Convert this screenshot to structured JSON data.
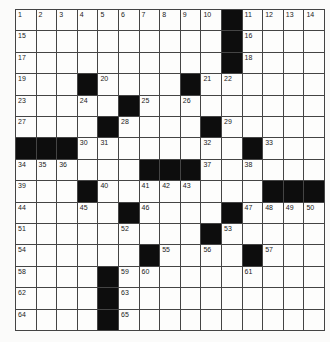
{
  "puzzle": {
    "rows": 15,
    "cols": 15,
    "colors": {
      "black": "#0d0d0d",
      "white": "#fdfdfc",
      "line": "#444444"
    },
    "layout": [
      "..........#....",
      "..........#....",
      "..........#....",
      "...#....#......",
      ".....#.........",
      "....#....#.....",
      "###........#...",
      "......###......",
      "...#........###",
      ".....#....#....",
      ".........#.....",
      "......#....#...",
      "....#..........",
      "....#..........",
      "....#.........."
    ],
    "numbers": [
      {
        "r": 0,
        "c": 0,
        "n": "1"
      },
      {
        "r": 0,
        "c": 1,
        "n": "2"
      },
      {
        "r": 0,
        "c": 2,
        "n": "3"
      },
      {
        "r": 0,
        "c": 3,
        "n": "4"
      },
      {
        "r": 0,
        "c": 4,
        "n": "5"
      },
      {
        "r": 0,
        "c": 5,
        "n": "6"
      },
      {
        "r": 0,
        "c": 6,
        "n": "7"
      },
      {
        "r": 0,
        "c": 7,
        "n": "8"
      },
      {
        "r": 0,
        "c": 8,
        "n": "9"
      },
      {
        "r": 0,
        "c": 9,
        "n": "10"
      },
      {
        "r": 0,
        "c": 11,
        "n": "11"
      },
      {
        "r": 0,
        "c": 12,
        "n": "12"
      },
      {
        "r": 0,
        "c": 13,
        "n": "13"
      },
      {
        "r": 0,
        "c": 14,
        "n": "14"
      },
      {
        "r": 1,
        "c": 0,
        "n": "15"
      },
      {
        "r": 1,
        "c": 11,
        "n": "16"
      },
      {
        "r": 2,
        "c": 0,
        "n": "17"
      },
      {
        "r": 2,
        "c": 11,
        "n": "18"
      },
      {
        "r": 3,
        "c": 0,
        "n": "19"
      },
      {
        "r": 3,
        "c": 4,
        "n": "20"
      },
      {
        "r": 3,
        "c": 9,
        "n": "21"
      },
      {
        "r": 3,
        "c": 10,
        "n": "22"
      },
      {
        "r": 4,
        "c": 0,
        "n": "23"
      },
      {
        "r": 4,
        "c": 3,
        "n": "24"
      },
      {
        "r": 4,
        "c": 6,
        "n": "25"
      },
      {
        "r": 4,
        "c": 8,
        "n": "26"
      },
      {
        "r": 5,
        "c": 0,
        "n": "27"
      },
      {
        "r": 5,
        "c": 5,
        "n": "28"
      },
      {
        "r": 5,
        "c": 10,
        "n": "29"
      },
      {
        "r": 6,
        "c": 3,
        "n": "30"
      },
      {
        "r": 6,
        "c": 4,
        "n": "31"
      },
      {
        "r": 6,
        "c": 9,
        "n": "32"
      },
      {
        "r": 6,
        "c": 12,
        "n": "33"
      },
      {
        "r": 7,
        "c": 0,
        "n": "34"
      },
      {
        "r": 7,
        "c": 1,
        "n": "35"
      },
      {
        "r": 7,
        "c": 2,
        "n": "36"
      },
      {
        "r": 7,
        "c": 9,
        "n": "37"
      },
      {
        "r": 7,
        "c": 11,
        "n": "38"
      },
      {
        "r": 8,
        "c": 0,
        "n": "39"
      },
      {
        "r": 8,
        "c": 4,
        "n": "40"
      },
      {
        "r": 8,
        "c": 6,
        "n": "41"
      },
      {
        "r": 8,
        "c": 7,
        "n": "42"
      },
      {
        "r": 8,
        "c": 8,
        "n": "43"
      },
      {
        "r": 9,
        "c": 0,
        "n": "44"
      },
      {
        "r": 9,
        "c": 3,
        "n": "45"
      },
      {
        "r": 9,
        "c": 6,
        "n": "46"
      },
      {
        "r": 9,
        "c": 11,
        "n": "47"
      },
      {
        "r": 9,
        "c": 12,
        "n": "48"
      },
      {
        "r": 9,
        "c": 13,
        "n": "49"
      },
      {
        "r": 9,
        "c": 14,
        "n": "50"
      },
      {
        "r": 10,
        "c": 0,
        "n": "51"
      },
      {
        "r": 10,
        "c": 5,
        "n": "52"
      },
      {
        "r": 10,
        "c": 10,
        "n": "53"
      },
      {
        "r": 11,
        "c": 0,
        "n": "54"
      },
      {
        "r": 11,
        "c": 7,
        "n": "55"
      },
      {
        "r": 11,
        "c": 9,
        "n": "56"
      },
      {
        "r": 11,
        "c": 12,
        "n": "57"
      },
      {
        "r": 12,
        "c": 0,
        "n": "58"
      },
      {
        "r": 12,
        "c": 5,
        "n": "59"
      },
      {
        "r": 12,
        "c": 6,
        "n": "60"
      },
      {
        "r": 12,
        "c": 11,
        "n": "61"
      },
      {
        "r": 13,
        "c": 0,
        "n": "62"
      },
      {
        "r": 13,
        "c": 5,
        "n": "63"
      },
      {
        "r": 14,
        "c": 0,
        "n": "64"
      },
      {
        "r": 14,
        "c": 5,
        "n": "65"
      }
    ]
  }
}
